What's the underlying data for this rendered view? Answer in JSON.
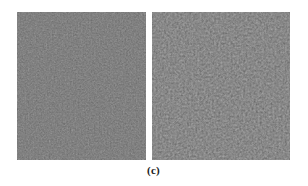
{
  "figure": {
    "caption": "(c)",
    "background_color": "#ffffff",
    "panel_count": 2,
    "panels": [
      {
        "id": "left",
        "name": "left-noise-image",
        "alt_text": "grayscale fine-grained noise image",
        "mean_gray": "#6e6e6e",
        "x": 17,
        "y": 12,
        "width": 129,
        "height": 148,
        "grain": "fine",
        "base_frequency": 0.62,
        "contrast": 0.3,
        "octaves": 3,
        "seed": 11
      },
      {
        "id": "right",
        "name": "right-noise-image",
        "alt_text": "grayscale coarser higher-contrast noise image",
        "mean_gray": "#707070",
        "x": 152,
        "y": 12,
        "width": 138,
        "height": 148,
        "grain": "coarse",
        "base_frequency": 0.48,
        "contrast": 0.42,
        "octaves": 4,
        "seed": 29
      }
    ]
  }
}
